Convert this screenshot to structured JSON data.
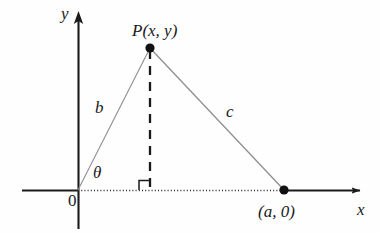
{
  "figure": {
    "type": "geometry-diagram",
    "background_color": "#fefefe",
    "ink_color": "#1a1a1a",
    "thin_line_color": "#8a8a8a"
  },
  "axes": {
    "y_axis_label": "y",
    "x_axis_label": "x",
    "origin_label": "0",
    "origin_px": [
      78,
      190
    ],
    "x_axis_y_px": 190,
    "y_axis_x_px": 78,
    "x_axis_arrow_tip_px": [
      366,
      190
    ],
    "y_axis_arrow_tip_px": [
      78,
      11
    ],
    "x_axis_solid_left_start_px": 22,
    "x_axis_dotted_from_px": 78,
    "x_axis_dotted_to_px": 284,
    "y_axis_bottom_px": 229
  },
  "points": [
    {
      "id": "P",
      "label": "P(x, y)",
      "px": [
        150,
        48
      ],
      "label_px": [
        132,
        22
      ],
      "marker": "filled-dot"
    },
    {
      "id": "A",
      "label": "(a, 0)",
      "px": [
        284,
        190
      ],
      "label_px": [
        258,
        203
      ],
      "marker": "filled-dot"
    }
  ],
  "segments": [
    {
      "id": "b",
      "label": "b",
      "from": "origin",
      "to": "P",
      "from_px": [
        78,
        190
      ],
      "to_px": [
        150,
        48
      ],
      "style": "thin-solid",
      "label_px": [
        95,
        99
      ]
    },
    {
      "id": "c",
      "label": "c",
      "from": "P",
      "to": "A",
      "from_px": [
        150,
        48
      ],
      "to_px": [
        284,
        190
      ],
      "style": "thin-solid",
      "label_px": [
        226,
        103
      ]
    },
    {
      "id": "height",
      "label": "",
      "from": "P",
      "to": "foot",
      "from_px": [
        150,
        48
      ],
      "to_px": [
        150,
        190
      ],
      "style": "dashed",
      "label_px": null
    }
  ],
  "angles": [
    {
      "id": "theta",
      "label": "θ",
      "at": "origin",
      "label_px": [
        93,
        164
      ],
      "marker": "none"
    },
    {
      "id": "right-angle",
      "label": "",
      "at": "foot",
      "marker": "square",
      "square_px": [
        139,
        180
      ],
      "square_size_px": 10
    }
  ],
  "labels": {
    "y": "y",
    "x": "x",
    "origin": "0",
    "theta": "θ",
    "side_b": "b",
    "side_c": "c",
    "point_p": "P(x, y)",
    "point_a": "(a, 0)"
  }
}
